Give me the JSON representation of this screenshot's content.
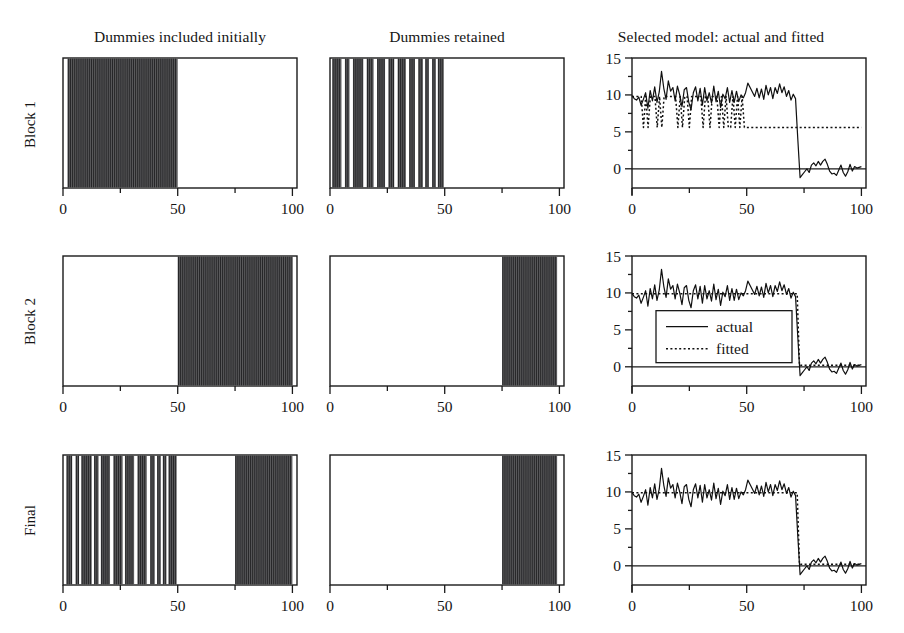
{
  "figure": {
    "columns": [
      {
        "title": "Dummies included initially"
      },
      {
        "title": "Dummies retained"
      },
      {
        "title": "Selected model: actual and fitted"
      }
    ],
    "rows": [
      {
        "label": "Block 1"
      },
      {
        "label": "Block 2"
      },
      {
        "label": "Final"
      }
    ],
    "legend": {
      "actual_label": "actual",
      "fitted_label": "fitted"
    },
    "colors": {
      "axis": "#1a1a1a",
      "band_fill": "#59595b",
      "band_stripe": "#262628",
      "line": "#101010",
      "background": "#ffffff"
    }
  },
  "chart_data": [
    {
      "id": "block1-dummies-included",
      "type": "bar",
      "title": "Dummies included initially",
      "row": "Block 1",
      "xlabel": "",
      "ylabel": "",
      "xlim": [
        0,
        102
      ],
      "ylim": [
        0,
        1
      ],
      "xticks": [
        0,
        25,
        50,
        75,
        100
      ],
      "xticklabels": [
        "0",
        "",
        "50",
        "",
        "100"
      ],
      "grid": false,
      "legend": "none",
      "bands": [
        {
          "start": 2,
          "end": 50,
          "style": "striped"
        }
      ]
    },
    {
      "id": "block1-dummies-retained",
      "type": "bar",
      "title": "Dummies retained",
      "row": "Block 1",
      "xlim": [
        0,
        102
      ],
      "ylim": [
        0,
        1
      ],
      "xticks": [
        0,
        25,
        50,
        75,
        100
      ],
      "xticklabels": [
        "0",
        "",
        "50",
        "",
        "100"
      ],
      "grid": false,
      "legend": "none",
      "bands": [
        {
          "start": 1,
          "end": 5,
          "style": "solid"
        },
        {
          "start": 6.5,
          "end": 8.5,
          "style": "solid"
        },
        {
          "start": 10,
          "end": 14.5,
          "style": "solid"
        },
        {
          "start": 16,
          "end": 19,
          "style": "solid"
        },
        {
          "start": 20.5,
          "end": 24,
          "style": "solid"
        },
        {
          "start": 25.5,
          "end": 28,
          "style": "solid"
        },
        {
          "start": 29.5,
          "end": 33,
          "style": "solid"
        },
        {
          "start": 34.5,
          "end": 37,
          "style": "solid"
        },
        {
          "start": 38.5,
          "end": 40.5,
          "style": "solid"
        },
        {
          "start": 41.5,
          "end": 43,
          "style": "solid"
        },
        {
          "start": 44.5,
          "end": 46,
          "style": "solid"
        },
        {
          "start": 47,
          "end": 49.5,
          "style": "solid"
        }
      ]
    },
    {
      "id": "block1-selected-model",
      "type": "line",
      "title": "Selected model: actual and fitted",
      "row": "Block 1",
      "xlim": [
        0,
        102
      ],
      "ylim": [
        -2.6,
        15
      ],
      "xticks": [
        0,
        25,
        50,
        75,
        100
      ],
      "xticklabels": [
        "0",
        "",
        "50",
        "",
        "100"
      ],
      "yticks": [
        0,
        2.5,
        5,
        7.5,
        10,
        12.5,
        15
      ],
      "yticklabels": [
        "0",
        "",
        "5",
        "",
        "10",
        "",
        "15"
      ],
      "grid": false,
      "legend": "none",
      "series": [
        {
          "name": "actual",
          "style": "solid",
          "values": [
            9.9,
            9.5,
            9.3,
            9.7,
            8.6,
            9.4,
            10.3,
            8.2,
            10.6,
            9.2,
            11.1,
            9.0,
            10.4,
            13.2,
            10.9,
            9.4,
            11.9,
            10.5,
            11.0,
            9.2,
            11.2,
            10.0,
            8.4,
            10.7,
            11.0,
            9.0,
            8.0,
            10.3,
            11.1,
            9.2,
            10.9,
            8.6,
            11.0,
            9.2,
            10.3,
            8.9,
            11.2,
            9.1,
            10.5,
            8.3,
            10.1,
            9.5,
            11.0,
            9.0,
            10.6,
            9.0,
            10.5,
            9.1,
            10.0,
            9.6,
            10.3,
            11.6,
            11.0,
            10.4,
            9.8,
            10.9,
            9.6,
            10.8,
            9.4,
            11.3,
            10.0,
            11.0,
            9.5,
            11.0,
            10.2,
            11.5,
            10.3,
            11.1,
            9.8,
            10.6,
            9.3,
            10.1,
            9.5,
            4.0,
            -1.2,
            -0.8,
            -0.4,
            0.0,
            -0.5,
            0.5,
            0.8,
            0.4,
            1.0,
            0.5,
            1.0,
            1.3,
            0.6,
            -0.3,
            -0.7,
            -0.6,
            -0.9,
            -0.2,
            0.5,
            -0.5,
            -1.0,
            -0.4,
            0.6,
            -0.3,
            0.3,
            0.1,
            0.2,
            0.3
          ]
        },
        {
          "name": "fitted",
          "style": "dotted",
          "values": [
            9.8,
            9.8,
            9.8,
            9.8,
            9.8,
            5.6,
            9.8,
            5.6,
            9.8,
            9.8,
            9.8,
            5.6,
            9.8,
            5.6,
            9.8,
            9.8,
            9.8,
            9.8,
            9.8,
            9.8,
            5.6,
            9.8,
            5.6,
            9.8,
            9.8,
            5.6,
            9.8,
            9.8,
            9.8,
            9.8,
            9.8,
            5.6,
            9.8,
            9.8,
            5.6,
            9.8,
            9.8,
            9.8,
            5.6,
            9.8,
            5.6,
            9.8,
            5.6,
            5.6,
            9.8,
            5.6,
            9.8,
            5.6,
            9.8,
            5.6,
            5.6,
            5.6,
            5.6,
            5.6,
            5.6,
            5.6,
            5.6,
            5.6,
            5.6,
            5.6,
            5.6,
            5.6,
            5.6,
            5.6,
            5.6,
            5.6,
            5.6,
            5.6,
            5.6,
            5.6,
            5.6,
            5.6,
            5.6,
            5.6,
            5.6,
            5.6,
            5.6,
            5.6,
            5.6,
            5.6,
            5.6,
            5.6,
            5.6,
            5.6,
            5.6,
            5.6,
            5.6,
            5.6,
            5.6,
            5.6,
            5.6,
            5.6,
            5.6,
            5.6,
            5.6,
            5.6,
            5.6,
            5.6,
            5.6,
            5.6,
            5.6
          ]
        }
      ]
    },
    {
      "id": "block2-dummies-included",
      "type": "bar",
      "title": "Dummies included initially",
      "row": "Block 2",
      "xlim": [
        0,
        102
      ],
      "ylim": [
        0,
        1
      ],
      "xticks": [
        0,
        25,
        50,
        75,
        100
      ],
      "xticklabels": [
        "0",
        "",
        "50",
        "",
        "100"
      ],
      "grid": false,
      "legend": "none",
      "bands": [
        {
          "start": 50,
          "end": 100,
          "style": "striped"
        }
      ]
    },
    {
      "id": "block2-dummies-retained",
      "type": "bar",
      "title": "Dummies retained",
      "row": "Block 2",
      "xlim": [
        0,
        102
      ],
      "ylim": [
        0,
        1
      ],
      "xticks": [
        0,
        25,
        50,
        75,
        100
      ],
      "xticklabels": [
        "0",
        "",
        "50",
        "",
        "100"
      ],
      "grid": false,
      "legend": "none",
      "bands": [
        {
          "start": 75,
          "end": 99,
          "style": "striped"
        }
      ]
    },
    {
      "id": "block2-selected-model",
      "type": "line",
      "title": "Selected model: actual and fitted",
      "row": "Block 2",
      "xlim": [
        0,
        102
      ],
      "ylim": [
        -2.6,
        15
      ],
      "xticks": [
        0,
        25,
        50,
        75,
        100
      ],
      "xticklabels": [
        "0",
        "",
        "50",
        "",
        "100"
      ],
      "yticks": [
        0,
        2.5,
        5,
        7.5,
        10,
        12.5,
        15
      ],
      "yticklabels": [
        "0",
        "",
        "5",
        "",
        "10",
        "",
        "15"
      ],
      "grid": false,
      "legend": "inside-lower-left",
      "series": [
        {
          "name": "actual",
          "style": "solid",
          "values": [
            9.9,
            9.5,
            9.3,
            9.7,
            8.6,
            9.4,
            10.3,
            8.2,
            10.6,
            9.2,
            11.1,
            9.0,
            10.4,
            13.2,
            10.9,
            9.4,
            11.9,
            10.5,
            11.0,
            9.2,
            11.2,
            10.0,
            8.4,
            10.7,
            11.0,
            9.0,
            8.0,
            10.3,
            11.1,
            9.2,
            10.9,
            8.6,
            11.0,
            9.2,
            10.3,
            8.9,
            11.2,
            9.1,
            10.5,
            8.3,
            10.1,
            9.5,
            11.0,
            9.0,
            10.6,
            9.0,
            10.5,
            9.1,
            10.0,
            9.6,
            10.3,
            11.6,
            11.0,
            10.4,
            9.8,
            10.9,
            9.6,
            10.8,
            9.4,
            11.3,
            10.0,
            11.0,
            9.5,
            11.0,
            10.2,
            11.5,
            10.3,
            11.1,
            9.8,
            10.6,
            9.3,
            10.1,
            9.5,
            4.0,
            -1.2,
            -0.8,
            -0.4,
            0.0,
            -0.5,
            0.5,
            0.8,
            0.4,
            1.0,
            0.5,
            1.0,
            1.3,
            0.6,
            -0.3,
            -0.7,
            -0.6,
            -0.9,
            -0.2,
            0.5,
            -0.5,
            -1.0,
            -0.4,
            0.6,
            -0.3,
            0.3,
            0.1,
            0.2,
            0.3
          ]
        },
        {
          "name": "fitted",
          "style": "dotted",
          "values": [
            9.9,
            9.9,
            9.9,
            9.9,
            9.9,
            9.9,
            9.9,
            9.9,
            9.9,
            9.9,
            9.9,
            9.9,
            9.9,
            9.9,
            9.9,
            9.9,
            9.9,
            9.9,
            9.9,
            9.9,
            9.9,
            9.9,
            9.9,
            9.9,
            9.9,
            9.9,
            9.9,
            9.9,
            9.9,
            9.9,
            9.9,
            9.9,
            9.9,
            9.9,
            9.9,
            9.9,
            9.9,
            9.9,
            9.9,
            9.9,
            9.9,
            9.9,
            9.9,
            9.9,
            9.9,
            9.9,
            9.9,
            9.9,
            9.9,
            9.9,
            9.9,
            9.9,
            9.9,
            9.9,
            9.9,
            9.9,
            9.9,
            9.9,
            9.9,
            9.9,
            9.9,
            9.9,
            9.9,
            9.9,
            9.9,
            9.9,
            9.9,
            9.9,
            9.9,
            9.9,
            9.9,
            9.9,
            9.9,
            0.2,
            0.2,
            0.2,
            0.2,
            0.2,
            0.2,
            0.2,
            0.2,
            0.2,
            0.2,
            0.2,
            0.2,
            0.2,
            0.2,
            0.2,
            0.2,
            0.2,
            0.2,
            0.2,
            0.2,
            0.2,
            0.2,
            0.2,
            0.2,
            0.2,
            0.2,
            0.2,
            0.2
          ]
        }
      ]
    },
    {
      "id": "final-dummies-included",
      "type": "bar",
      "title": "Dummies included initially",
      "row": "Final",
      "xlim": [
        0,
        102
      ],
      "ylim": [
        0,
        1
      ],
      "xticks": [
        0,
        25,
        50,
        75,
        100
      ],
      "xticklabels": [
        "0",
        "",
        "50",
        "",
        "100"
      ],
      "grid": false,
      "legend": "none",
      "bands": [
        {
          "start": 1.5,
          "end": 4.0,
          "style": "solid"
        },
        {
          "start": 5.5,
          "end": 7.0,
          "style": "solid"
        },
        {
          "start": 8.0,
          "end": 12.5,
          "style": "solid"
        },
        {
          "start": 13.5,
          "end": 15.5,
          "style": "solid"
        },
        {
          "start": 16.5,
          "end": 20.5,
          "style": "solid"
        },
        {
          "start": 22.0,
          "end": 26.0,
          "style": "solid"
        },
        {
          "start": 27.0,
          "end": 31.0,
          "style": "solid"
        },
        {
          "start": 32.5,
          "end": 36.5,
          "style": "solid"
        },
        {
          "start": 38.0,
          "end": 40.0,
          "style": "solid"
        },
        {
          "start": 41.0,
          "end": 42.5,
          "style": "solid"
        },
        {
          "start": 43.5,
          "end": 45.0,
          "style": "solid"
        },
        {
          "start": 46.0,
          "end": 49.5,
          "style": "solid"
        },
        {
          "start": 75.0,
          "end": 100.0,
          "style": "striped"
        }
      ]
    },
    {
      "id": "final-dummies-retained",
      "type": "bar",
      "title": "Dummies retained",
      "row": "Final",
      "xlim": [
        0,
        102
      ],
      "ylim": [
        0,
        1
      ],
      "xticks": [
        0,
        25,
        50,
        75,
        100
      ],
      "xticklabels": [
        "0",
        "",
        "50",
        "",
        "100"
      ],
      "grid": false,
      "legend": "none",
      "bands": [
        {
          "start": 75,
          "end": 99,
          "style": "striped"
        }
      ]
    },
    {
      "id": "final-selected-model",
      "type": "line",
      "title": "Selected model: actual and fitted",
      "row": "Final",
      "xlim": [
        0,
        102
      ],
      "ylim": [
        -2.6,
        15
      ],
      "xticks": [
        0,
        25,
        50,
        75,
        100
      ],
      "xticklabels": [
        "0",
        "",
        "50",
        "",
        "100"
      ],
      "yticks": [
        0,
        2.5,
        5,
        7.5,
        10,
        12.5,
        15
      ],
      "yticklabels": [
        "0",
        "",
        "5",
        "",
        "10",
        "",
        "15"
      ],
      "grid": false,
      "legend": "none",
      "series": [
        {
          "name": "actual",
          "style": "solid",
          "values": [
            9.9,
            9.5,
            9.3,
            9.7,
            8.6,
            9.4,
            10.3,
            8.2,
            10.6,
            9.2,
            11.1,
            9.0,
            10.4,
            13.2,
            10.9,
            9.4,
            11.9,
            10.5,
            11.0,
            9.2,
            11.2,
            10.0,
            8.4,
            10.7,
            11.0,
            9.0,
            8.0,
            10.3,
            11.1,
            9.2,
            10.9,
            8.6,
            11.0,
            9.2,
            10.3,
            8.9,
            11.2,
            9.1,
            10.5,
            8.3,
            10.1,
            9.5,
            11.0,
            9.0,
            10.6,
            9.0,
            10.5,
            9.1,
            10.0,
            9.6,
            10.3,
            11.6,
            11.0,
            10.4,
            9.8,
            10.9,
            9.6,
            10.8,
            9.4,
            11.3,
            10.0,
            11.0,
            9.5,
            11.0,
            10.2,
            11.5,
            10.3,
            11.1,
            9.8,
            10.6,
            9.3,
            10.1,
            9.5,
            4.0,
            -1.2,
            -0.8,
            -0.4,
            0.0,
            -0.5,
            0.5,
            0.8,
            0.4,
            1.0,
            0.5,
            1.0,
            1.3,
            0.6,
            -0.3,
            -0.7,
            -0.6,
            -0.9,
            -0.2,
            0.5,
            -0.5,
            -1.0,
            -0.4,
            0.6,
            -0.3,
            0.3,
            0.1,
            0.2,
            0.3
          ]
        },
        {
          "name": "fitted",
          "style": "dotted",
          "values": [
            9.9,
            9.9,
            9.9,
            9.9,
            9.9,
            9.9,
            9.9,
            9.9,
            9.9,
            9.9,
            9.9,
            9.9,
            9.9,
            9.9,
            9.9,
            9.9,
            9.9,
            9.9,
            9.9,
            9.9,
            9.9,
            9.9,
            9.9,
            9.9,
            9.9,
            9.9,
            9.9,
            9.9,
            9.9,
            9.9,
            9.9,
            9.9,
            9.9,
            9.9,
            9.9,
            9.9,
            9.9,
            9.9,
            9.9,
            9.9,
            9.9,
            9.9,
            9.9,
            9.9,
            9.9,
            9.9,
            9.9,
            9.9,
            9.9,
            9.9,
            9.9,
            9.9,
            9.9,
            9.9,
            9.9,
            9.9,
            9.9,
            9.9,
            9.9,
            9.9,
            9.9,
            9.9,
            9.9,
            9.9,
            9.9,
            9.9,
            9.9,
            9.9,
            9.9,
            9.9,
            9.9,
            9.9,
            9.9,
            0.2,
            0.2,
            0.2,
            0.2,
            0.2,
            0.2,
            0.2,
            0.2,
            0.2,
            0.2,
            0.2,
            0.2,
            0.2,
            0.2,
            0.2,
            0.2,
            0.2,
            0.2,
            0.2,
            0.2,
            0.2,
            0.2,
            0.2,
            0.2,
            0.2,
            0.2,
            0.2,
            0.2
          ]
        }
      ]
    }
  ]
}
